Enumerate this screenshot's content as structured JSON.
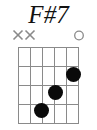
{
  "chord": {
    "name": "F#7",
    "title_color": "#111111",
    "instrument": "guitar",
    "string_count": 6,
    "fret_count": 4,
    "starting_fret": 1,
    "position_label": "",
    "grid_color": "#8a8a8a",
    "dot_color": "#0a0a0a",
    "marker_color": "#8a8a8a",
    "open_marker_glyph": "O",
    "muted_marker_glyph": "X",
    "string_markers": [
      {
        "string": 1,
        "type": "muted",
        "glyph": "X",
        "x": 18
      },
      {
        "string": 2,
        "type": "muted",
        "glyph": "X",
        "x": 30
      },
      {
        "string": 3,
        "type": "none",
        "glyph": "",
        "x": 43
      },
      {
        "string": 4,
        "type": "none",
        "glyph": "",
        "x": 55
      },
      {
        "string": 5,
        "type": "none",
        "glyph": "",
        "x": 67
      },
      {
        "string": 6,
        "type": "open",
        "glyph": "O",
        "x": 79
      }
    ],
    "fingerings": [
      {
        "string": 5,
        "fret": 2,
        "x": 73,
        "y": 74
      },
      {
        "string": 4,
        "fret": 3,
        "x": 55,
        "y": 92
      },
      {
        "string": 3,
        "fret": 4,
        "x": 41,
        "y": 110
      }
    ],
    "grid_geometry": {
      "left": 18,
      "top": 47,
      "width": 61,
      "height": 77,
      "string_x": [
        0,
        12.2,
        24.4,
        36.6,
        48.8,
        61
      ],
      "fret_y": [
        0,
        19.25,
        38.5,
        57.75,
        77
      ]
    }
  }
}
